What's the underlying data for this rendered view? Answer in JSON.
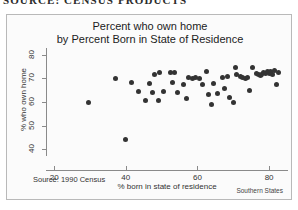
{
  "page_header": "SOURCE: CENSUS PRODUCTS",
  "figure": {
    "title_line1": "Percent who own home",
    "title_line2": "by Percent Born in State of Residence",
    "source_note": "Source: 1990 Census",
    "caption": "Southern States"
  },
  "chart_data": {
    "type": "scatter",
    "title": "Percent who own home by Percent Born in State of Residence",
    "xlabel": "% born in state of residence",
    "ylabel": "% who own home",
    "xlim": [
      18,
      85
    ],
    "ylim": [
      38,
      82
    ],
    "xticks": [
      20,
      40,
      60,
      80
    ],
    "yticks": [
      40,
      50,
      60,
      70,
      80
    ],
    "grid": false,
    "legend": null,
    "marker": "filled-circle",
    "marker_color": "#333333",
    "points": [
      {
        "x": 29.5,
        "y": 60.0
      },
      {
        "x": 37.0,
        "y": 69.8
      },
      {
        "x": 41.5,
        "y": 68.2
      },
      {
        "x": 40.0,
        "y": 44.0
      },
      {
        "x": 46.5,
        "y": 67.8
      },
      {
        "x": 45.5,
        "y": 60.8
      },
      {
        "x": 43.5,
        "y": 64.5
      },
      {
        "x": 47.5,
        "y": 64.2
      },
      {
        "x": 48.0,
        "y": 71.5
      },
      {
        "x": 49.5,
        "y": 72.5
      },
      {
        "x": 50.5,
        "y": 64.3
      },
      {
        "x": 49.0,
        "y": 60.5
      },
      {
        "x": 52.5,
        "y": 72.3
      },
      {
        "x": 53.5,
        "y": 72.6
      },
      {
        "x": 53.0,
        "y": 68.3
      },
      {
        "x": 54.5,
        "y": 64.2
      },
      {
        "x": 56.0,
        "y": 67.5
      },
      {
        "x": 57.5,
        "y": 70.3
      },
      {
        "x": 58.5,
        "y": 70.0
      },
      {
        "x": 59.5,
        "y": 70.2
      },
      {
        "x": 60.5,
        "y": 69.8
      },
      {
        "x": 57.0,
        "y": 61.5
      },
      {
        "x": 62.5,
        "y": 72.8
      },
      {
        "x": 61.5,
        "y": 67.5
      },
      {
        "x": 64.5,
        "y": 68.0
      },
      {
        "x": 63.0,
        "y": 63.0
      },
      {
        "x": 65.5,
        "y": 63.5
      },
      {
        "x": 64.0,
        "y": 58.8
      },
      {
        "x": 67.0,
        "y": 70.5
      },
      {
        "x": 68.5,
        "y": 70.8
      },
      {
        "x": 67.5,
        "y": 65.8
      },
      {
        "x": 69.0,
        "y": 62.0
      },
      {
        "x": 70.5,
        "y": 74.5
      },
      {
        "x": 71.0,
        "y": 71.5
      },
      {
        "x": 72.0,
        "y": 71.0
      },
      {
        "x": 72.5,
        "y": 70.3
      },
      {
        "x": 73.5,
        "y": 70.0
      },
      {
        "x": 74.0,
        "y": 70.5
      },
      {
        "x": 70.0,
        "y": 60.0
      },
      {
        "x": 75.5,
        "y": 74.8
      },
      {
        "x": 76.5,
        "y": 72.0
      },
      {
        "x": 77.0,
        "y": 71.6
      },
      {
        "x": 77.5,
        "y": 71.2
      },
      {
        "x": 78.0,
        "y": 71.8
      },
      {
        "x": 78.5,
        "y": 72.4
      },
      {
        "x": 79.0,
        "y": 71.9
      },
      {
        "x": 79.5,
        "y": 72.8
      },
      {
        "x": 80.0,
        "y": 72.2
      },
      {
        "x": 80.5,
        "y": 73.0
      },
      {
        "x": 81.0,
        "y": 71.5
      },
      {
        "x": 81.5,
        "y": 73.5
      },
      {
        "x": 82.5,
        "y": 72.5
      },
      {
        "x": 82.0,
        "y": 67.5
      },
      {
        "x": 74.5,
        "y": 65.0
      }
    ]
  }
}
